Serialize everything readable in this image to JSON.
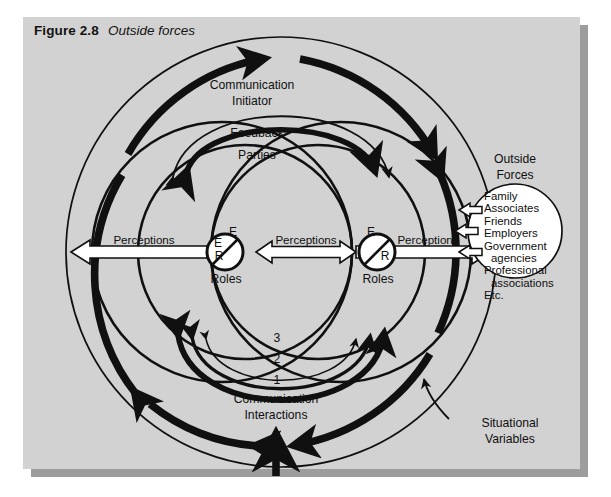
{
  "figure": {
    "number": "Figure 2.8",
    "title": "Outside forces"
  },
  "colors": {
    "panel_bg": "#d2d2d2",
    "page_bg": "#ffffff",
    "shadow": "#9d9d9d",
    "ink": "#101010",
    "arrow_fill": "#ffffff"
  },
  "diagram": {
    "type": "communication-model",
    "outer_ring_label": "Situational Variables",
    "labels": {
      "communication_initiator": {
        "line1": "Communication",
        "line2": "Initiator"
      },
      "feedback": "Feedback",
      "parties": "Parties",
      "communication_interactions": {
        "line1": "Communication",
        "line2": "Interactions"
      },
      "situational_variables": {
        "line1": "Situational",
        "line2": "Variables"
      },
      "outside_forces_heading": {
        "line1": "Outside",
        "line2": "Forces"
      }
    },
    "perceptions": [
      {
        "id": "left",
        "label": "Perceptions",
        "direction": "left"
      },
      {
        "id": "center",
        "label": "Perceptions",
        "direction": "both"
      },
      {
        "id": "right",
        "label": "Perceptions",
        "direction": "right"
      }
    ],
    "roles": [
      {
        "id": "left-party",
        "label": "Roles",
        "top_letter": "E",
        "bottom_letter": "R"
      },
      {
        "id": "right-party",
        "label": "Roles",
        "top_letter": "E",
        "bottom_letter": "R"
      }
    ],
    "interaction_arcs": [
      {
        "number": "3",
        "weight": "thin"
      },
      {
        "number": "2",
        "weight": "medium"
      },
      {
        "number": "1",
        "weight": "thick"
      }
    ],
    "outside_forces_list": [
      {
        "text": "Family",
        "indent": false
      },
      {
        "text": "Associates",
        "indent": false
      },
      {
        "text": "Friends",
        "indent": false
      },
      {
        "text": "Employers",
        "indent": false
      },
      {
        "text": "Government",
        "indent": false
      },
      {
        "text": "agencies",
        "indent": true
      },
      {
        "text": "Professional",
        "indent": false
      },
      {
        "text": "associations",
        "indent": true
      },
      {
        "text": "Etc.",
        "indent": false
      }
    ]
  }
}
